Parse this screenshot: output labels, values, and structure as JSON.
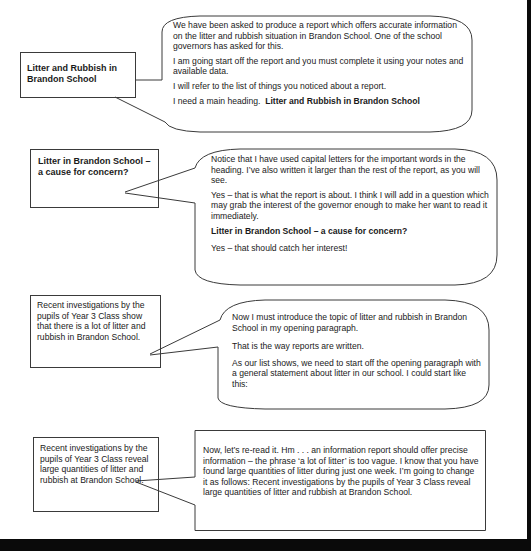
{
  "sections": [
    {
      "note": "Litter and Rubbish in Brandon School",
      "note_bold": true,
      "bubble_shape": "rounded",
      "paragraphs": [
        {
          "text": "We have been asked to produce a report which offers accurate information on the litter and rubbish situation in Brandon School. One of the school governors has asked for this."
        },
        {
          "text": "I am going start off the report and you must complete it using your notes and available data."
        },
        {
          "text": "I will refer to the list of things you noticed about a report."
        },
        {
          "text": "I need a main heading.",
          "bold_suffix": "Litter and Rubbish in Brandon School"
        }
      ]
    },
    {
      "note": "Litter in Brandon School – a cause for concern?",
      "note_bold": true,
      "bubble_shape": "rounded",
      "paragraphs": [
        {
          "text": "Notice that I have used capital letters for the important words in the heading. I’ve also written it larger than the rest of the report, as you will see."
        },
        {
          "text": "Yes – that is what the report is about. I think I will add in a question which may grab the interest of the governor enough to make her want to read it immediately."
        },
        {
          "text": "Litter in Brandon School – a cause for concern?",
          "bold": true
        },
        {
          "text": "Yes – that should catch her interest!"
        }
      ]
    },
    {
      "note": "Recent investigations by the pupils of Year 3 Class show that there is a lot of litter and rubbish in Brandon School.",
      "note_bold": false,
      "bubble_shape": "rounded",
      "paragraphs": [
        {
          "text": "Now I must introduce the topic of litter and rubbish in Brandon School in my opening paragraph."
        },
        {
          "text": "That is the way reports are written."
        },
        {
          "text": "As our list shows, we need to start off the opening paragraph with a general statement about litter in our school. I could start like this:"
        }
      ]
    },
    {
      "note": "Recent investigations by the pupils of Year 3 Class reveal large quantities of litter and rubbish at Brandon School.",
      "note_bold": false,
      "bubble_shape": "rectangle",
      "paragraphs": [
        {
          "text": "Now, let’s re-read it. Hm . . . an information report should offer precise information – the phrase ‘a lot of litter’ is too vague. I know that you have found large quantities of litter during just one week. I’m going to change it as follows: Recent investigations by the pupils of Year 3 Class reveal large quantities of litter and rubbish at Brandon School."
        }
      ]
    }
  ],
  "colors": {
    "stroke": "#3a3a3a",
    "text": "#1a1a1a",
    "frame": "#0a0a0a"
  }
}
